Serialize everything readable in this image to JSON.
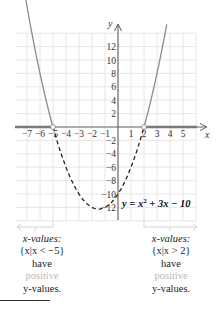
{
  "chart_data": {
    "type": "line",
    "title": "",
    "equation": "y = x² + 3x − 10",
    "xlabel": "x",
    "ylabel": "y",
    "xlim": [
      -7.9,
      6.0
    ],
    "ylim": [
      -14,
      14
    ],
    "x_ticks": [
      -7,
      -6,
      -5,
      -4,
      -3,
      -2,
      -1,
      1,
      2,
      3,
      4,
      5
    ],
    "x_tick_labels": [
      "−7",
      "−6",
      "−5",
      "−4",
      "−3",
      "−2",
      "−1",
      "1",
      "2",
      "3",
      "4",
      "5"
    ],
    "y_ticks": [
      12,
      10,
      8,
      6,
      4,
      2,
      -2,
      -4,
      -6,
      -8,
      -10,
      -12
    ],
    "y_tick_labels": [
      "12",
      "10",
      "8",
      "6",
      "4",
      "2",
      "−2",
      "−4",
      "−6",
      "−8",
      "−10",
      "−12"
    ],
    "grid": true,
    "grid_x_step": 1,
    "grid_y_step": 2,
    "series": [
      {
        "name": "y = x² + 3x − 10 (y > 0, solid)",
        "style": "solid",
        "color": "#8a8a8a",
        "domain": [
          [
            -7.2,
            -5
          ],
          [
            2,
            3.8
          ]
        ]
      },
      {
        "name": "y = x² + 3x − 10 (y < 0, dashed)",
        "style": "dashed",
        "color": "#222222",
        "domain": [
          -5,
          2
        ]
      }
    ],
    "roots": [
      -5,
      2
    ],
    "vertex": [
      -1.5,
      -12.25
    ],
    "y_intercept": -10,
    "highlighted_x_intervals": [
      {
        "interval": "x < -5",
        "color": "#7a7a7a"
      },
      {
        "interval": "x > 2",
        "color": "#7a7a7a"
      }
    ]
  },
  "axis": {
    "x_label": "x",
    "y_label": "y"
  },
  "equation_label": {
    "prefix": "y = x",
    "exp": "2",
    "suffix": " + 3x − 10"
  },
  "captions": {
    "left": {
      "line1": "x-values:",
      "line2": "{x|x < −5}",
      "line3": "have",
      "line4": "positive",
      "line5": "y-values."
    },
    "right": {
      "line1": "x-values:",
      "line2": "{x|x > 2}",
      "line3": "have",
      "line4": "positive",
      "line5": "y-values."
    }
  },
  "colors": {
    "grid": "#dedede",
    "axis": "#555555",
    "solid_curve": "#8a8a8a",
    "dashed_curve": "#222222",
    "highlight": "#7a7a7a",
    "positive_text": "#b8b8b8",
    "bracket": "#c8c8c8"
  }
}
